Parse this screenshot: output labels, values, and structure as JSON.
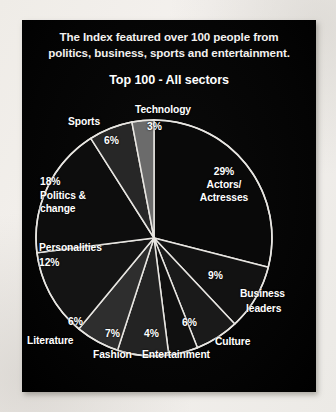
{
  "card": {
    "headline_line1": "The Index featured over 100 people from",
    "headline_line2": "politics, business, sports and entertainment.",
    "subtitle": "Top 100 - All sectors"
  },
  "colors": {
    "card_background": "#050505",
    "page_background": "#f2efeb",
    "text": "#ffffff",
    "slice_outline": "#e8e6e2",
    "slice_fills": [
      "#090909",
      "#121212",
      "#1a1a1a",
      "#101010",
      "#232323",
      "#2e2e2e",
      "#141414",
      "#0d0d0d",
      "#272727",
      "#6b6b6b"
    ]
  },
  "chart_data": {
    "type": "pie",
    "title": "Top 100 - All sectors",
    "subtitle": "The Index featured over 100 people from politics, business, sports and entertainment.",
    "xlabel": "",
    "ylabel": "",
    "legend_position": "none",
    "grid": false,
    "units": "percent",
    "start_angle_deg": 0,
    "direction": "clockwise",
    "total": 100,
    "categories": [
      "Actors/Actresses",
      "Business leaders",
      "Culture",
      "Entertainment",
      "Fashion",
      "Literature",
      "Personalities",
      "Politics & change",
      "Sports",
      "Technology"
    ],
    "values": [
      29,
      9,
      6,
      4,
      7,
      6,
      12,
      18,
      6,
      3
    ],
    "slices": [
      {
        "label": "Actors/",
        "label2": "Actresses",
        "pct": "29%",
        "value": 29,
        "fill": "#090909"
      },
      {
        "label": "Business",
        "label2": "leaders",
        "pct": "9%",
        "value": 9,
        "fill": "#121212"
      },
      {
        "label": "Culture",
        "label2": "",
        "pct": "6%",
        "value": 6,
        "fill": "#1a1a1a"
      },
      {
        "label": "Entertainment",
        "label2": "",
        "pct": "4%",
        "value": 4,
        "fill": "#101010"
      },
      {
        "label": "Fashion",
        "label2": "",
        "pct": "7%",
        "value": 7,
        "fill": "#232323"
      },
      {
        "label": "Literature",
        "label2": "",
        "pct": "6%",
        "value": 6,
        "fill": "#2e2e2e"
      },
      {
        "label": "Personalities",
        "label2": "",
        "pct": "12%",
        "value": 12,
        "fill": "#141414"
      },
      {
        "label": "Politics &",
        "label2": "change",
        "pct": "18%",
        "value": 18,
        "fill": "#0d0d0d"
      },
      {
        "label": "Sports",
        "label2": "",
        "pct": "6%",
        "value": 6,
        "fill": "#272727"
      },
      {
        "label": "Technology",
        "label2": "",
        "pct": "3%",
        "value": 3,
        "fill": "#6b6b6b"
      }
    ]
  },
  "labels": {
    "technology": "Technology",
    "technology_pct": "3%",
    "sports": "Sports",
    "sports_pct": "6%",
    "politics_pct": "18%",
    "politics_l1": "Politics &",
    "politics_l2": "change",
    "personalities": "Personalities",
    "personalities_pct": "12%",
    "literature": "Literature",
    "literature_pct": "6%",
    "fashion": "Fashion",
    "fashion_pct": "7%",
    "entertainment": "Entertainment",
    "entertainment_pct": "4%",
    "culture": "Culture",
    "culture_pct": "6%",
    "business_l1": "Business",
    "business_l2": "leaders",
    "business_pct": "9%",
    "actors_pct": "29%",
    "actors_l1": "Actors/",
    "actors_l2": "Actresses"
  }
}
